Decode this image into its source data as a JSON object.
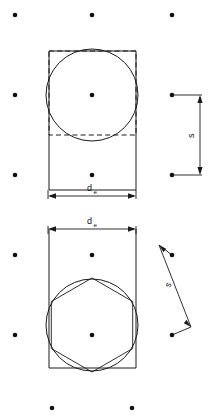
{
  "figure": {
    "canvas": {
      "width": 215,
      "height": 419,
      "background": "#ffffff"
    },
    "stroke_color": "#1a1a1a",
    "dot_color": "#111111",
    "labels": {
      "diameter_main": "d",
      "diameter_sub": "e",
      "spacing": "s"
    },
    "grid_dots": {
      "columns_x": [
        15,
        92,
        172
      ],
      "rows_y": [
        15,
        95,
        175,
        335
      ],
      "radius": 2.2,
      "points": [
        {
          "x": 15,
          "y": 15
        },
        {
          "x": 92,
          "y": 15
        },
        {
          "x": 172,
          "y": 15
        },
        {
          "x": 15,
          "y": 95
        },
        {
          "x": 92,
          "y": 95
        },
        {
          "x": 172,
          "y": 95
        },
        {
          "x": 15,
          "y": 175
        },
        {
          "x": 92,
          "y": 175
        },
        {
          "x": 172,
          "y": 175
        },
        {
          "x": 15,
          "y": 255
        },
        {
          "x": 92,
          "y": 255
        },
        {
          "x": 172,
          "y": 255
        },
        {
          "x": 15,
          "y": 335
        },
        {
          "x": 92,
          "y": 335
        },
        {
          "x": 172,
          "y": 335
        },
        {
          "x": 52,
          "y": 408
        },
        {
          "x": 132,
          "y": 408
        }
      ]
    },
    "upper_figure": {
      "name": "circle-in-square",
      "rectangle": {
        "x": 49,
        "y": 51,
        "width": 87,
        "height": 139
      },
      "dashed_square": {
        "x": 49,
        "y": 51,
        "width": 87,
        "height": 84
      },
      "circle": {
        "cx": 92,
        "cy": 95,
        "r": 46
      },
      "center_dot": {
        "x": 92,
        "y": 95
      },
      "dimension_de": {
        "label": "d",
        "sublabel": "e",
        "orientation": "horizontal",
        "y": 196,
        "x1": 48,
        "x2": 136
      },
      "dimension_s": {
        "label": "s",
        "orientation": "vertical",
        "x": 200,
        "y1": 95,
        "y2": 175,
        "from_dot": {
          "x": 172,
          "y": 95
        },
        "to_dot": {
          "x": 172,
          "y": 175
        }
      }
    },
    "lower_figure": {
      "name": "hexagon-in-circle",
      "rectangle": {
        "x": 49,
        "y": 229,
        "width": 87,
        "height": 139
      },
      "circle": {
        "cx": 92,
        "cy": 325,
        "r": 46
      },
      "hexagon": {
        "cx": 92,
        "cy": 325,
        "r": 47,
        "rotation_deg": 90,
        "sides": 6
      },
      "center_dot": {
        "x": 92,
        "y": 325
      },
      "dimension_de": {
        "label": "d",
        "sublabel": "e",
        "orientation": "horizontal",
        "y": 229,
        "x1": 48,
        "x2": 136
      },
      "dimension_s": {
        "label": "s",
        "orientation": "diagonal",
        "x1": 158,
        "y1": 246,
        "x2": 191,
        "y2": 326,
        "from_dot": {
          "x": 172,
          "y": 255
        },
        "to_dot": {
          "x": 172,
          "y": 335
        }
      }
    }
  }
}
